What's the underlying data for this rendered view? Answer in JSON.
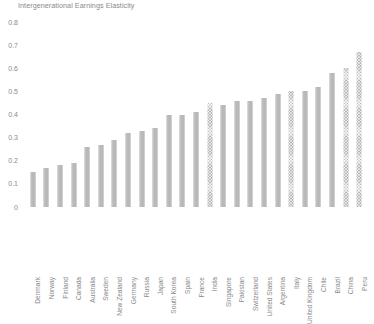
{
  "chart_data": {
    "type": "bar",
    "title": "Intergenerational Earnings Elasticity",
    "xlabel": "",
    "ylabel": "",
    "ylim": [
      0,
      0.8
    ],
    "ytick_step": 0.1,
    "yticks": [
      "0.8",
      "0.7",
      "0.6",
      "0.5",
      "0.4",
      "0.3",
      "0.2",
      "0.1",
      "0"
    ],
    "grid": false,
    "legend": null,
    "orientation": "vertical",
    "bar_color": "#bfbfbf",
    "categories": [
      "Denmark",
      "Norway",
      "Finland",
      "Canada",
      "Australia",
      "Sweden",
      "New Zealand",
      "Germany",
      "Russia",
      "Japan",
      "South Korea",
      "Spain",
      "France",
      "India",
      "Singapore",
      "Pakistan",
      "Switzerland",
      "United States",
      "Argentina",
      "Italy",
      "United Kingdom",
      "Chile",
      "Brazil",
      "China",
      "Peru"
    ],
    "values": [
      0.15,
      0.17,
      0.18,
      0.19,
      0.26,
      0.27,
      0.29,
      0.32,
      0.33,
      0.34,
      0.4,
      0.4,
      0.41,
      0.45,
      0.44,
      0.46,
      0.46,
      0.47,
      0.49,
      0.5,
      0.5,
      0.52,
      0.58,
      0.6,
      0.67
    ],
    "textured_bars": [
      13,
      19,
      23,
      24
    ]
  }
}
